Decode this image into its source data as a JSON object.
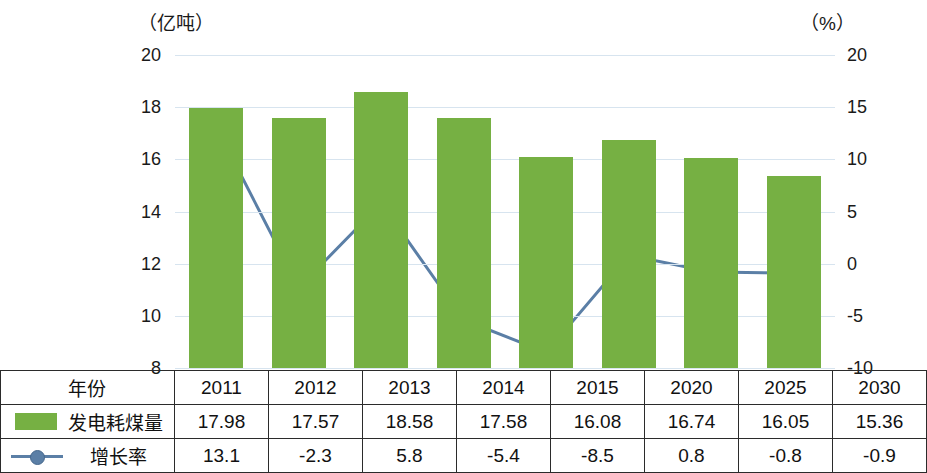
{
  "axis_units": {
    "left": "（亿吨）",
    "right": "（%）"
  },
  "chart_data": {
    "type": "bar",
    "title": "",
    "xlabel": "",
    "ylabel": "（亿吨）",
    "y2label": "（%）",
    "categories": [
      "2011",
      "2012",
      "2013",
      "2014",
      "2015",
      "2020",
      "2025",
      "2030"
    ],
    "ylim": [
      8,
      20
    ],
    "yticks": [
      8,
      10,
      12,
      14,
      16,
      18,
      20
    ],
    "y2lim": [
      -10,
      20
    ],
    "y2ticks": [
      -10,
      -5,
      0,
      5,
      10,
      15,
      20
    ],
    "grid": true,
    "legend_position": "table-left",
    "series": [
      {
        "name": "发电耗煤量",
        "type": "bar",
        "color": "#76b043",
        "axis": "left",
        "values": [
          17.98,
          17.57,
          18.58,
          17.58,
          16.08,
          16.74,
          16.05,
          15.36
        ]
      },
      {
        "name": "增长率",
        "type": "line",
        "color": "#5b7fa6",
        "axis": "right",
        "values": [
          13.1,
          -2.3,
          5.8,
          -5.4,
          -8.5,
          0.8,
          -0.8,
          -0.9
        ]
      }
    ]
  },
  "table": {
    "row_year_label": "年份",
    "row_bar_label": "发电耗煤量",
    "row_line_label": "增长率",
    "years": [
      "2011",
      "2012",
      "2013",
      "2014",
      "2015",
      "2020",
      "2025",
      "2030"
    ],
    "coal": [
      "17.98",
      "17.57",
      "18.58",
      "17.58",
      "16.08",
      "16.74",
      "16.05",
      "15.36"
    ],
    "growth": [
      "13.1",
      "-2.3",
      "5.8",
      "-5.4",
      "-8.5",
      "0.8",
      "-0.8",
      "-0.9"
    ]
  },
  "ticks": {
    "left": [
      "20",
      "18",
      "16",
      "14",
      "12",
      "10",
      "8"
    ],
    "right": [
      "20",
      "15",
      "10",
      "5",
      "0",
      "-5",
      "-10"
    ]
  }
}
